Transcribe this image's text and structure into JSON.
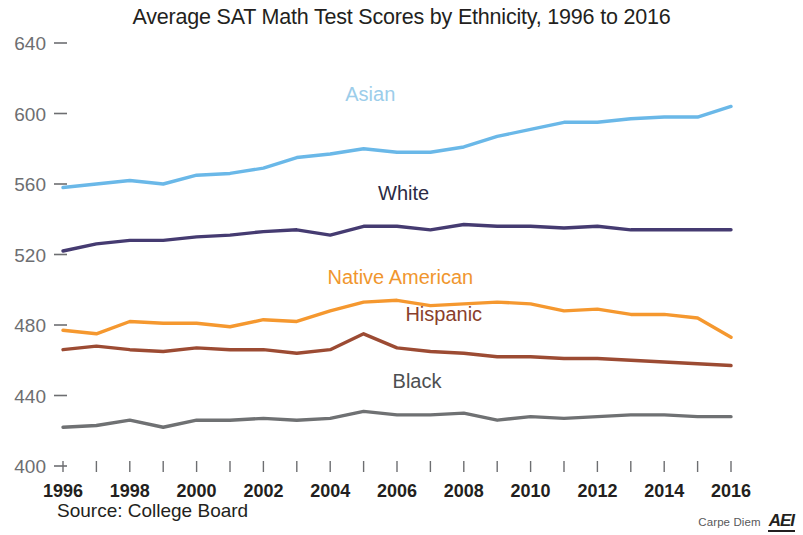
{
  "chart_data": {
    "type": "line",
    "title": "Average SAT Math Test Scores by Ethnicity, 1996 to 2016",
    "xlabel": "",
    "ylabel": "",
    "grid": false,
    "legend_position": "inline-labels",
    "source": "Source: College Board",
    "credit": "Carpe Diem",
    "logo": "AEI",
    "x": [
      1996,
      1997,
      1998,
      1999,
      2000,
      2001,
      2002,
      2003,
      2004,
      2005,
      2006,
      2007,
      2008,
      2009,
      2010,
      2011,
      2012,
      2013,
      2014,
      2015,
      2016
    ],
    "xlim": [
      1996,
      2016
    ],
    "ylim": [
      400,
      640
    ],
    "yticks": [
      400,
      440,
      480,
      520,
      560,
      600,
      640
    ],
    "xticks_labeled": [
      1996,
      1998,
      2000,
      2002,
      2004,
      2006,
      2008,
      2010,
      2012,
      2014,
      2016
    ],
    "series": [
      {
        "name": "Asian",
        "color": "#6ab8e8",
        "label_color": "#9ccdea",
        "values": [
          558,
          560,
          562,
          560,
          565,
          566,
          569,
          575,
          577,
          580,
          578,
          578,
          581,
          587,
          591,
          595,
          595,
          597,
          598,
          598,
          604
        ]
      },
      {
        "name": "White",
        "color": "#453b71",
        "label_color": "#2b2b45",
        "values": [
          522,
          526,
          528,
          528,
          530,
          531,
          533,
          534,
          531,
          536,
          536,
          534,
          537,
          536,
          536,
          535,
          536,
          534,
          534,
          534,
          534
        ]
      },
      {
        "name": "Native American",
        "color": "#f5982f",
        "label_color": "#f0962e",
        "values": [
          477,
          475,
          482,
          481,
          481,
          479,
          483,
          482,
          488,
          493,
          494,
          491,
          492,
          493,
          492,
          488,
          489,
          486,
          486,
          484,
          473
        ]
      },
      {
        "name": "Hispanic",
        "color": "#9c4b33",
        "label_color": "#8a3f2c",
        "values": [
          466,
          468,
          466,
          465,
          467,
          466,
          466,
          464,
          466,
          475,
          467,
          465,
          464,
          462,
          462,
          461,
          461,
          460,
          459,
          458,
          457
        ]
      },
      {
        "name": "Black",
        "color": "#6f7173",
        "label_color": "#4d4f51",
        "values": [
          422,
          423,
          426,
          422,
          426,
          426,
          427,
          426,
          427,
          431,
          429,
          429,
          430,
          426,
          428,
          427,
          428,
          429,
          429,
          428,
          428
        ]
      }
    ],
    "series_label_positions": [
      {
        "name": "Asian",
        "x": 2005.2,
        "y": 607
      },
      {
        "name": "White",
        "x": 2006.2,
        "y": 551
      },
      {
        "name": "Native American",
        "x": 2006.1,
        "y": 503
      },
      {
        "name": "Hispanic",
        "x": 2007.4,
        "y": 482
      },
      {
        "name": "Black",
        "x": 2006.6,
        "y": 444
      }
    ]
  }
}
